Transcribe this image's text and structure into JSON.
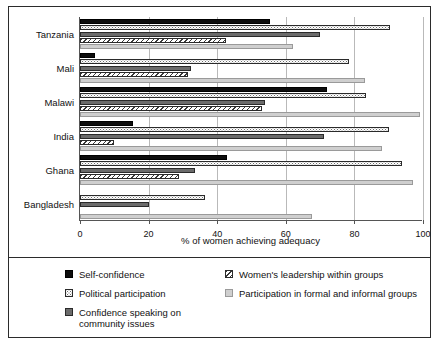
{
  "chart_data": {
    "type": "bar",
    "orientation": "horizontal",
    "title": "",
    "xlabel": "% of women achieving adequacy",
    "ylabel": "",
    "xlim": [
      0,
      100
    ],
    "xticks": [
      0,
      20,
      40,
      60,
      80,
      100
    ],
    "grid": true,
    "legend_position": "bottom",
    "categories": [
      "Tanzania",
      "Mali",
      "Malawi",
      "India",
      "Ghana",
      "Bangladesh"
    ],
    "series": [
      {
        "name": "Self-confidence",
        "swatch": "solid-black",
        "color": "#0d0d0d",
        "values": [
          55.5,
          4.5,
          72.0,
          15.5,
          43.0,
          0
        ]
      },
      {
        "name": "Political participation",
        "swatch": "white-dotted",
        "color": "#ffffff",
        "values": [
          90.5,
          78.5,
          83.5,
          90.0,
          94.0,
          36.5
        ]
      },
      {
        "name": "Confidence speaking on community issues",
        "swatch": "dark-gray",
        "color": "#6b6b6b",
        "values": [
          70.0,
          32.5,
          54.0,
          71.0,
          33.5,
          20.0
        ]
      },
      {
        "name": "Women's leadership within groups",
        "swatch": "diagonal-hatch",
        "color": "#f2f2f2",
        "values": [
          42.5,
          31.5,
          53.0,
          10.0,
          29.0,
          0
        ]
      },
      {
        "name": "Participation in formal and informal groups",
        "swatch": "light-gray",
        "color": "#cfcfcf",
        "values": [
          62.0,
          83.0,
          99.0,
          88.0,
          97.0,
          67.5
        ]
      }
    ]
  },
  "legend": {
    "left_column": [
      {
        "label": "Self-confidence",
        "swatch": "solid-black"
      },
      {
        "label": "Political participation",
        "swatch": "white-dotted"
      },
      {
        "label": "Confidence speaking on community issues",
        "swatch": "dark-gray"
      }
    ],
    "right_column": [
      {
        "label": "Women's leadership within groups",
        "swatch": "diagonal-hatch"
      },
      {
        "label": "Participation in formal and informal groups",
        "swatch": "light-gray"
      }
    ]
  }
}
